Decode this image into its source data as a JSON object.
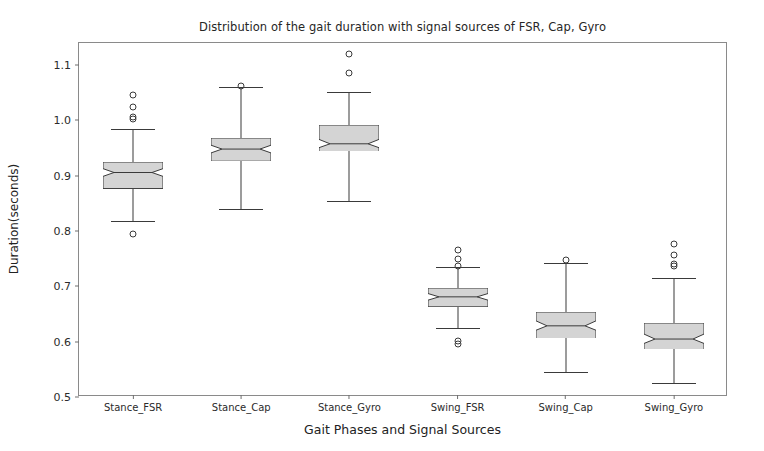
{
  "chart_data": {
    "type": "box",
    "title": "Distribution of the gait duration with signal sources of FSR, Cap, Gyro",
    "xlabel": "Gait Phases and Signal Sources",
    "ylabel": "Duration(seconds)",
    "ylim": [
      0.5,
      1.14
    ],
    "yticks": [
      0.5,
      0.6,
      0.7,
      0.8,
      0.9,
      1.0,
      1.1
    ],
    "ytick_labels": [
      "0.5",
      "0.6",
      "0.7",
      "0.8",
      "0.9",
      "1.0",
      "1.1"
    ],
    "grid": false,
    "legend": null,
    "notched": true,
    "box_facecolor": "#d4d4d4",
    "box_edgecolor": "#3a3a3a",
    "categories": [
      "Stance_FSR",
      "Stance_Cap",
      "Stance_Gyro",
      "Swing_FSR",
      "Swing_Cap",
      "Swing_Gyro"
    ],
    "boxes": [
      {
        "label": "Stance_FSR",
        "whisker_low": 0.818,
        "q1": 0.876,
        "median": 0.905,
        "q3": 0.924,
        "whisker_high": 0.985,
        "notch_low": 0.898,
        "notch_high": 0.912,
        "outliers": [
          1.046,
          1.025,
          1.006,
          1.002,
          0.795
        ]
      },
      {
        "label": "Stance_Cap",
        "whisker_low": 0.84,
        "q1": 0.926,
        "median": 0.948,
        "q3": 0.968,
        "whisker_high": 1.06,
        "notch_low": 0.941,
        "notch_high": 0.955,
        "outliers": [
          1.062
        ]
      },
      {
        "label": "Stance_Gyro",
        "whisker_low": 0.855,
        "q1": 0.944,
        "median": 0.958,
        "q3": 0.992,
        "whisker_high": 1.052,
        "notch_low": 0.951,
        "notch_high": 0.966,
        "outliers": [
          1.12,
          1.086
        ]
      },
      {
        "label": "Swing_FSR",
        "whisker_low": 0.625,
        "q1": 0.663,
        "median": 0.681,
        "q3": 0.697,
        "whisker_high": 0.735,
        "notch_low": 0.675,
        "notch_high": 0.687,
        "outliers": [
          0.766,
          0.75,
          0.736,
          0.602,
          0.596
        ]
      },
      {
        "label": "Swing_Cap",
        "whisker_low": 0.545,
        "q1": 0.606,
        "median": 0.629,
        "q3": 0.654,
        "whisker_high": 0.742,
        "notch_low": 0.621,
        "notch_high": 0.638,
        "outliers": [
          0.748
        ]
      },
      {
        "label": "Swing_Gyro",
        "whisker_low": 0.525,
        "q1": 0.586,
        "median": 0.605,
        "q3": 0.634,
        "whisker_high": 0.716,
        "notch_low": 0.597,
        "notch_high": 0.614,
        "outliers": [
          0.776,
          0.756,
          0.74,
          0.736
        ]
      }
    ]
  }
}
